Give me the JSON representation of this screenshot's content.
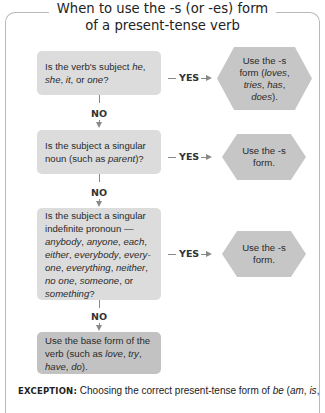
{
  "title": {
    "line1": "When to use the -s (or -es) form",
    "line2": "of a present-tense verb"
  },
  "flow": {
    "questions": [
      {
        "id": "q1",
        "segments": [
          [
            "Is the verb's subject ",
            false
          ],
          [
            "he",
            true
          ],
          [
            ", ",
            false
          ],
          [
            "she",
            true
          ],
          [
            ", ",
            false
          ],
          [
            "it",
            true
          ],
          [
            ", or ",
            false
          ],
          [
            "one",
            true
          ],
          [
            "?",
            false
          ]
        ]
      },
      {
        "id": "q2",
        "segments": [
          [
            "Is the subject a singular noun (such as ",
            false
          ],
          [
            "parent",
            true
          ],
          [
            ")?",
            false
          ]
        ]
      },
      {
        "id": "q3",
        "segments": [
          [
            "Is the subject a singular indefinite pronoun — ",
            false
          ],
          [
            "anybody",
            true
          ],
          [
            ", ",
            false
          ],
          [
            "anyone",
            true
          ],
          [
            ", ",
            false
          ],
          [
            "each",
            true
          ],
          [
            ", ",
            false
          ],
          [
            "either",
            true
          ],
          [
            ", ",
            false
          ],
          [
            "everybody",
            true
          ],
          [
            ", ",
            false
          ],
          [
            "every-one",
            true
          ],
          [
            ", ",
            false
          ],
          [
            "everything",
            true
          ],
          [
            ", ",
            false
          ],
          [
            "neither",
            true
          ],
          [
            ", ",
            false
          ],
          [
            "no one",
            true
          ],
          [
            ", ",
            false
          ],
          [
            "someone",
            true
          ],
          [
            ", or ",
            false
          ],
          [
            "something",
            true
          ],
          [
            "?",
            false
          ]
        ]
      }
    ],
    "outcomes": [
      {
        "id": "o1",
        "segments": [
          [
            "Use the -s form (",
            false
          ],
          [
            "loves",
            true
          ],
          [
            ", ",
            false
          ],
          [
            "tries",
            true
          ],
          [
            ", ",
            false
          ],
          [
            "has",
            true
          ],
          [
            ", ",
            false
          ],
          [
            "does",
            true
          ],
          [
            ").",
            false
          ]
        ]
      },
      {
        "id": "o2",
        "segments": [
          [
            "Use the -s form.",
            false
          ]
        ]
      },
      {
        "id": "o3",
        "segments": [
          [
            "Use the -s form.",
            false
          ]
        ]
      }
    ],
    "final": {
      "segments": [
        [
          "Use the base form of the verb (such as ",
          false
        ],
        [
          "love",
          true
        ],
        [
          ", ",
          false
        ],
        [
          "try",
          true
        ],
        [
          ", ",
          false
        ],
        [
          "have",
          true
        ],
        [
          ", ",
          false
        ],
        [
          "do",
          true
        ],
        [
          ").",
          false
        ]
      ]
    },
    "yes_label": "YES",
    "no_label": "NO"
  },
  "exception": {
    "label": "EXCEPTION:",
    "text_segments": [
      [
        " Choosing the correct present-tense form of ",
        false
      ],
      [
        "be",
        true
      ],
      [
        " (",
        false
      ],
      [
        "am",
        true
      ],
      [
        ", ",
        false
      ],
      [
        "is",
        true
      ],
      [
        ",",
        false
      ]
    ]
  },
  "colors": {
    "question_box": "#dcdcdc",
    "final_box": "#c2c2c2",
    "outcome_hex": "#c6c6c6",
    "frame": "#b8b8b8",
    "connector": "#888888"
  }
}
